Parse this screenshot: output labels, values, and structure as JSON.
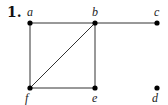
{
  "problem_number": "1.",
  "graph": {
    "vertices": [
      {
        "id": "a",
        "label": "a",
        "x": 30,
        "y": 23,
        "label_pos": "above"
      },
      {
        "id": "b",
        "label": "b",
        "x": 95,
        "y": 23,
        "label_pos": "above"
      },
      {
        "id": "c",
        "label": "c",
        "x": 157,
        "y": 23,
        "label_pos": "above"
      },
      {
        "id": "d",
        "label": "d",
        "x": 157,
        "y": 88,
        "label_pos": "below"
      },
      {
        "id": "e",
        "label": "e",
        "x": 95,
        "y": 88,
        "label_pos": "below"
      },
      {
        "id": "f",
        "label": "f",
        "x": 30,
        "y": 88,
        "label_pos": "below"
      }
    ],
    "edges": [
      [
        "a",
        "b"
      ],
      [
        "b",
        "c"
      ],
      [
        "a",
        "f"
      ],
      [
        "b",
        "f"
      ],
      [
        "b",
        "e"
      ],
      [
        "f",
        "e"
      ]
    ]
  }
}
